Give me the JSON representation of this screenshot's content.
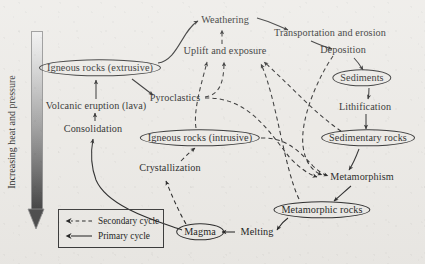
{
  "figure": {
    "background_color": "#eceae6",
    "ink_color": "#1a1a1a"
  },
  "axis": {
    "label": "Increasing heat and pressure",
    "direction": "downward",
    "gradient_from": "#efefef",
    "gradient_to": "#3b3b3b"
  },
  "legend": {
    "items": [
      {
        "label": "Secondary cycle",
        "style": "dashed"
      },
      {
        "label": "Primary cycle",
        "style": "solid"
      }
    ]
  },
  "nodes": [
    {
      "id": "igneous_extrusive",
      "label": "Igneous rocks (extrusive)",
      "shape": "ellipse",
      "x": 100,
      "y": 68
    },
    {
      "id": "volcanic_eruption",
      "label": "Volcanic eruption (lava)",
      "shape": "plain",
      "x": 96,
      "y": 106
    },
    {
      "id": "consolidation",
      "label": "Consolidation",
      "shape": "plain",
      "x": 93,
      "y": 129
    },
    {
      "id": "pyroclastics",
      "label": "Pyroclastics",
      "shape": "plain",
      "x": 175,
      "y": 98
    },
    {
      "id": "weathering",
      "label": "Weathering",
      "shape": "plain",
      "x": 225,
      "y": 20
    },
    {
      "id": "uplift_exposure",
      "label": "Uplift and exposure",
      "shape": "plain",
      "x": 225,
      "y": 51
    },
    {
      "id": "transportation_erosion",
      "label": "Transportation and erosion",
      "shape": "plain",
      "x": 330,
      "y": 33
    },
    {
      "id": "deposition",
      "label": "Deposition",
      "shape": "plain",
      "x": 343,
      "y": 50
    },
    {
      "id": "sediments",
      "label": "Sediments",
      "shape": "ellipse",
      "x": 362,
      "y": 78
    },
    {
      "id": "lithification",
      "label": "Lithification",
      "shape": "plain",
      "x": 365,
      "y": 107
    },
    {
      "id": "sedimentary_rocks",
      "label": "Sedimentary rocks",
      "shape": "ellipse",
      "x": 368,
      "y": 138
    },
    {
      "id": "igneous_intrusive",
      "label": "Igneous rocks (intrusive)",
      "shape": "ellipse",
      "x": 200,
      "y": 138
    },
    {
      "id": "crystallization",
      "label": "Crystallization",
      "shape": "plain",
      "x": 170,
      "y": 168
    },
    {
      "id": "metamorphism",
      "label": "Metamorphism",
      "shape": "plain",
      "x": 362,
      "y": 177
    },
    {
      "id": "metamorphic_rocks",
      "label": "Metamorphic rocks",
      "shape": "ellipse",
      "x": 322,
      "y": 210
    },
    {
      "id": "magma",
      "label": "Magma",
      "shape": "ellipse",
      "x": 200,
      "y": 232
    },
    {
      "id": "melting",
      "label": "Melting",
      "shape": "plain",
      "x": 257,
      "y": 232
    }
  ],
  "edges": [
    {
      "from": "consolidation",
      "to": "volcanic_eruption",
      "style": "solid"
    },
    {
      "from": "volcanic_eruption",
      "to": "igneous_extrusive",
      "style": "solid"
    },
    {
      "from": "igneous_extrusive",
      "to": "weathering",
      "style": "solid"
    },
    {
      "from": "igneous_extrusive",
      "to": "pyroclastics",
      "style": "solid"
    },
    {
      "from": "weathering",
      "to": "transportation_erosion",
      "style": "solid"
    },
    {
      "from": "transportation_erosion",
      "to": "deposition",
      "style": "solid"
    },
    {
      "from": "deposition",
      "to": "sediments",
      "style": "solid"
    },
    {
      "from": "sediments",
      "to": "lithification",
      "style": "solid"
    },
    {
      "from": "lithification",
      "to": "sedimentary_rocks",
      "style": "solid"
    },
    {
      "from": "sedimentary_rocks",
      "to": "metamorphism",
      "style": "solid"
    },
    {
      "from": "metamorphism",
      "to": "metamorphic_rocks",
      "style": "solid"
    },
    {
      "from": "metamorphic_rocks",
      "to": "melting",
      "style": "solid"
    },
    {
      "from": "melting",
      "to": "magma",
      "style": "solid"
    },
    {
      "from": "magma",
      "to": "consolidation",
      "style": "solid"
    },
    {
      "from": "magma",
      "to": "crystallization",
      "style": "dashed"
    },
    {
      "from": "crystallization",
      "to": "igneous_intrusive",
      "style": "solid"
    },
    {
      "from": "uplift_exposure",
      "to": "weathering",
      "style": "dashed"
    },
    {
      "from": "igneous_intrusive",
      "to": "uplift_exposure",
      "style": "dashed"
    },
    {
      "from": "pyroclastics",
      "to": "uplift_exposure",
      "style": "dashed"
    },
    {
      "from": "sedimentary_rocks",
      "to": "uplift_exposure",
      "style": "dashed"
    },
    {
      "from": "metamorphic_rocks",
      "to": "uplift_exposure",
      "style": "dashed"
    },
    {
      "from": "pyroclastics",
      "to": "metamorphism",
      "style": "dashed"
    },
    {
      "from": "igneous_intrusive",
      "to": "metamorphism",
      "style": "dashed"
    },
    {
      "from": "deposition",
      "to": "metamorphism",
      "style": "dashed"
    }
  ]
}
